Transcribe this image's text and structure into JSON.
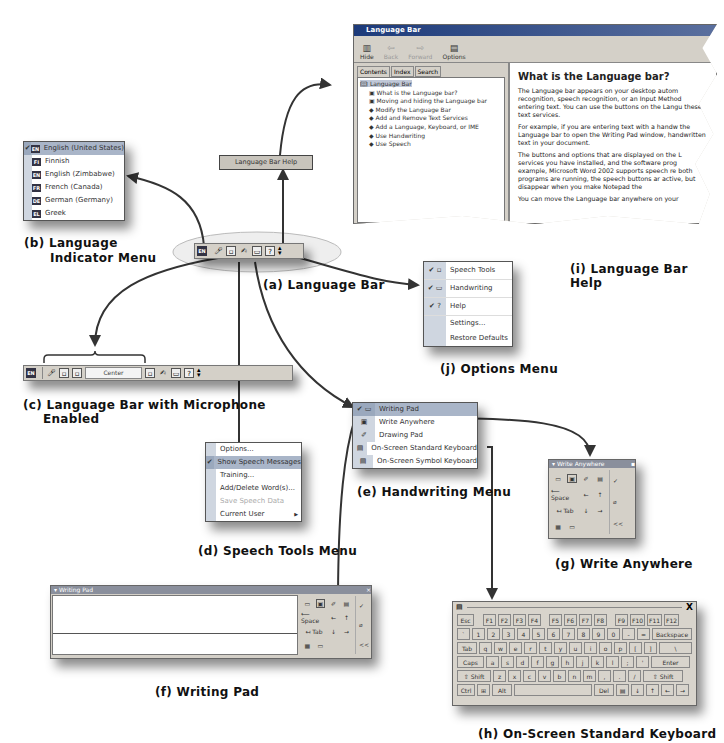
{
  "captions": {
    "a": "(a) Language Bar",
    "b": "(b) Language Indicator Menu",
    "b_line1": "(b) Language",
    "b_line2": "Indicator Menu",
    "c": "(c) Language Bar with Microphone Enabled",
    "c_line1": "(c) Language Bar with Microphone",
    "c_line2": "Enabled",
    "d": "(d) Speech Tools Menu",
    "e": "(e) Handwriting Menu",
    "f": "(f) Writing Pad",
    "g": "(g) Write Anywhere",
    "h": "(h) On-Screen Standard Keyboard",
    "i": "(i) Language Bar Help",
    "j": "(j) Options Menu"
  },
  "language_menu": {
    "items": [
      {
        "code": "EN",
        "label": "English (United States)",
        "checked": true
      },
      {
        "code": "FI",
        "label": "Finnish",
        "checked": false
      },
      {
        "code": "EN",
        "label": "English (Zimbabwe)",
        "checked": false
      },
      {
        "code": "FR",
        "label": "French (Canada)",
        "checked": false
      },
      {
        "code": "DE",
        "label": "German (Germany)",
        "checked": false
      },
      {
        "code": "EL",
        "label": "Greek",
        "checked": false
      }
    ]
  },
  "language_bar": {
    "lang_code": "EN",
    "tooltip": "Language Bar Help",
    "icons": [
      "microphone-icon",
      "speech-tools-icon",
      "handwriting-icon",
      "writing-pad-icon",
      "help-icon",
      "options-icon"
    ]
  },
  "language_bar_mic": {
    "lang_code": "EN",
    "status_field": "Center"
  },
  "help_window": {
    "title": "Language Bar",
    "toolbar": {
      "hide": "Hide",
      "back": "Back",
      "forward": "Forward",
      "options": "Options"
    },
    "tabs": [
      "Contents",
      "Index",
      "Search"
    ],
    "tree": [
      {
        "label": "Language Bar",
        "type": "book-open",
        "level": 0,
        "selected": true
      },
      {
        "label": "What is the Language bar?",
        "type": "page",
        "level": 1
      },
      {
        "label": "Moving and hiding the Language bar",
        "type": "page",
        "level": 1
      },
      {
        "label": "Modify the Language Bar",
        "type": "book",
        "level": 1
      },
      {
        "label": "Add and Remove Text Services",
        "type": "book",
        "level": 1
      },
      {
        "label": "Add a Language, Keyboard, or IME",
        "type": "book",
        "level": 1
      },
      {
        "label": "Use Handwriting",
        "type": "book",
        "level": 1
      },
      {
        "label": "Use Speech",
        "type": "book",
        "level": 1
      }
    ],
    "heading": "What is the Language bar?",
    "paragraphs": [
      "The Language bar appears on your desktop autom recognition, speech recognition, or an Input Method entering text. You can use the buttons on the Langu these text services.",
      "For example, if you are entering text with a handw the Language bar to open the Writing Pad window, handwritten text in your document.",
      "The buttons and options that are displayed on the L services you have installed, and the software prog example, Microsoft Word 2002 supports speech re both programs are running, the speech buttons ar active, but disappear when you make Notepad the",
      "You can move the Language bar anywhere on your"
    ]
  },
  "options_menu": {
    "items": [
      {
        "label": "Speech Tools",
        "checked": true,
        "icon": "speech-tools-icon"
      },
      {
        "label": "Handwriting",
        "checked": true,
        "icon": "handwriting-icon"
      },
      {
        "label": "Help",
        "checked": true,
        "icon": "help-icon"
      },
      {
        "label": "Settings...",
        "checked": false
      },
      {
        "label": "Restore Defaults",
        "checked": false
      }
    ]
  },
  "speech_tools_menu": {
    "items": [
      {
        "label": "Options...",
        "checked": false,
        "disabled": false
      },
      {
        "label": "Show Speech Messages",
        "checked": true,
        "disabled": false,
        "highlighted": true
      },
      {
        "label": "Training...",
        "checked": false,
        "disabled": false
      },
      {
        "label": "Add/Delete Word(s)...",
        "checked": false,
        "disabled": false
      },
      {
        "label": "Save Speech Data",
        "checked": false,
        "disabled": true
      },
      {
        "label": "Current User",
        "checked": false,
        "disabled": false,
        "submenu": true
      }
    ]
  },
  "handwriting_menu": {
    "items": [
      {
        "label": "Writing Pad",
        "checked": true,
        "highlighted": true
      },
      {
        "label": "Write Anywhere",
        "checked": false
      },
      {
        "label": "Drawing Pad",
        "checked": false
      },
      {
        "label": "On-Screen Standard Keyboard",
        "checked": false
      },
      {
        "label": "On-Screen Symbol Keyboard",
        "checked": false
      }
    ]
  },
  "write_anywhere": {
    "title": "Write Anywhere",
    "space": "Space",
    "tab": "Tab",
    "collapse": "<<"
  },
  "writing_pad": {
    "title": "Writing Pad",
    "space": "Space",
    "tab": "Tab",
    "collapse": "<<"
  },
  "keyboard": {
    "close": "X",
    "rows": [
      [
        "Esc",
        "F1",
        "F2",
        "F3",
        "F4",
        "F5",
        "F6",
        "F7",
        "F8",
        "F9",
        "F10",
        "F11",
        "F12"
      ],
      [
        "`",
        "1",
        "2",
        "3",
        "4",
        "5",
        "6",
        "7",
        "8",
        "9",
        "0",
        "-",
        "=",
        "Backspace"
      ],
      [
        "Tab",
        "q",
        "w",
        "e",
        "r",
        "t",
        "y",
        "u",
        "i",
        "o",
        "p",
        "[",
        "]",
        "\\"
      ],
      [
        "Caps",
        "a",
        "s",
        "d",
        "f",
        "g",
        "h",
        "j",
        "k",
        "l",
        ";",
        "'",
        "Enter"
      ],
      [
        "⇧ Shift",
        "z",
        "x",
        "c",
        "v",
        "b",
        "n",
        "m",
        ",",
        ".",
        "/",
        "⇧ Shift"
      ],
      [
        "Ctrl",
        "⊞",
        "Alt",
        " ",
        "Del",
        "▤",
        "↓",
        "↑",
        "←",
        "→"
      ]
    ]
  }
}
